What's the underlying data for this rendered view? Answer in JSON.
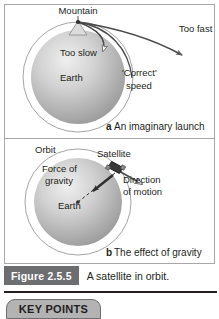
{
  "figure": {
    "tag": "Figure 2.5.5",
    "caption": "A satellite in orbit."
  },
  "panel_a": {
    "caption_letter": "a",
    "caption_text": "An imaginary launch",
    "labels": {
      "mountain": "Mountain",
      "too_fast": "Too fast",
      "too_slow": "Too slow",
      "earth": "Earth",
      "correct_speed_line1": "'Correct'",
      "correct_speed_line2": "speed"
    }
  },
  "panel_b": {
    "caption_letter": "b",
    "caption_text": "The effect of gravity",
    "labels": {
      "orbit": "Orbit",
      "satellite": "Satellite",
      "force_line1": "Force of",
      "force_line2": "gravity",
      "direction_line1": "Direction",
      "direction_line2": "of motion",
      "earth": "Earth"
    }
  },
  "key_points": {
    "label": "KEY POINTS"
  },
  "colors": {
    "ink": "#231f20",
    "tag_bg": "#6d6e70",
    "tab_bg": "#b3b3b3",
    "panel_border": "#a8a8a8",
    "earth_light": "#e8e8e8",
    "earth_mid": "#bcbcbc",
    "earth_dark": "#9a9a9a",
    "orbit_stroke": "#9a9a9a"
  }
}
